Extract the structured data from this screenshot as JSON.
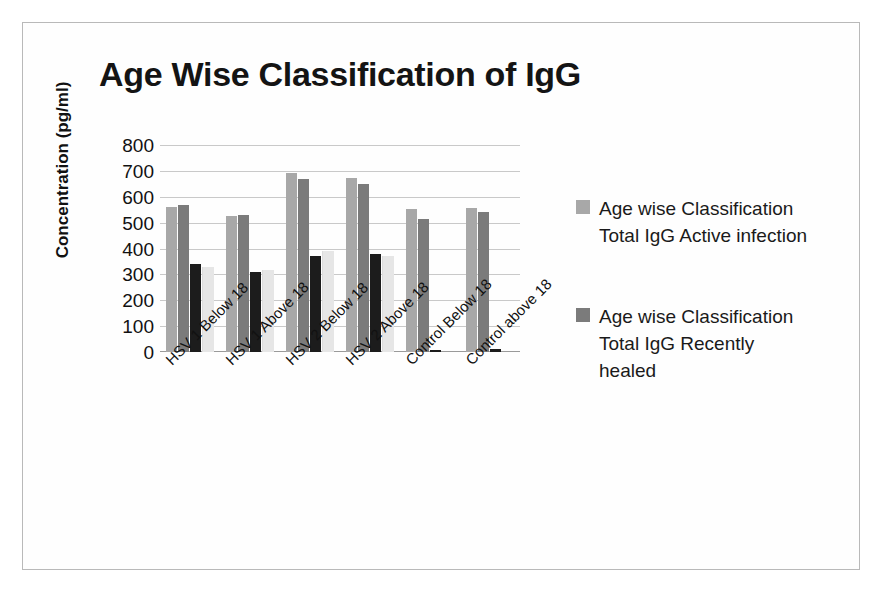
{
  "chart_data": {
    "type": "bar",
    "title": "Age Wise Classification of IgG",
    "xlabel": "",
    "ylabel": "Concentration (pg/ml)",
    "ylim": [
      0,
      800
    ],
    "ytick_values": [
      800,
      700,
      600,
      500,
      400,
      300,
      200,
      100,
      0
    ],
    "grid": true,
    "legend_position": "right",
    "categories": [
      "HSV 1 Below 18",
      "HSV 1 Above 18",
      "HSV 2 Below 18",
      "HSV 2 Above 18",
      "Control Below 18",
      "Control above 18"
    ],
    "series": [
      {
        "name": "Age wise Classification  Total IgG Active infection",
        "color": "#a8a8a8",
        "in_legend": true,
        "values": [
          560,
          525,
          690,
          672,
          552,
          555
        ]
      },
      {
        "name": "Age wise Classification  Total IgG Recently healed",
        "color": "#7b7b7b",
        "in_legend": true,
        "values": [
          568,
          530,
          670,
          650,
          515,
          540
        ]
      },
      {
        "name": "series-3",
        "color": "#1c1c1c",
        "in_legend": false,
        "values": [
          340,
          308,
          370,
          380,
          8,
          10
        ]
      },
      {
        "name": "series-4",
        "color": "#e6e6e6",
        "in_legend": false,
        "values": [
          330,
          318,
          390,
          372,
          0,
          0
        ]
      }
    ]
  },
  "legend": {
    "items": [
      {
        "swatch_color": "#a8a8a8",
        "line1": "Age wise",
        "line2": "Classification  Total",
        "line3": "IgG Active infection"
      },
      {
        "swatch_color": "#7b7b7b",
        "line1": "Age wise",
        "line2": "Classification  Total",
        "line3": "IgG Recently healed"
      }
    ]
  }
}
